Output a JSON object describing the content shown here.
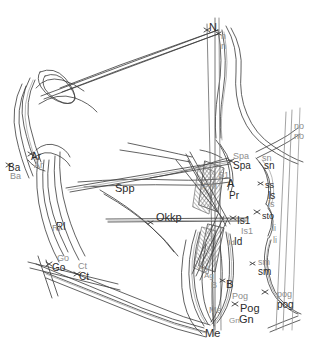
{
  "figure": {
    "kind": "cephalometric-tracing-superimposition",
    "background_color": "#ffffff",
    "line_color_primary": "#3a3a3a",
    "line_color_secondary": "#9a9a9a",
    "hatch_color": "#6f6f6f"
  },
  "labels": [
    {
      "id": "N",
      "text": "N",
      "x": 209,
      "y": 22,
      "tone": "dark",
      "size": "s11"
    },
    {
      "id": "n1",
      "text": "n",
      "x": 221,
      "y": 32,
      "tone": "grey",
      "size": "s9"
    },
    {
      "id": "n2",
      "text": "n",
      "x": 221,
      "y": 42,
      "tone": "grey",
      "size": "s9"
    },
    {
      "id": "no1",
      "text": "no",
      "x": 294,
      "y": 122,
      "tone": "grey",
      "size": "s9"
    },
    {
      "id": "no2",
      "text": "no",
      "x": 294,
      "y": 132,
      "tone": "grey",
      "size": "s9"
    },
    {
      "id": "Ar1",
      "text": "Ar",
      "x": 31,
      "y": 152,
      "tone": "dark",
      "size": "s10"
    },
    {
      "id": "Ar2",
      "text": "Ar",
      "x": 34,
      "y": 161,
      "tone": "grey",
      "size": "s9"
    },
    {
      "id": "Ba1",
      "text": "Ba",
      "x": 8,
      "y": 163,
      "tone": "dark",
      "size": "s10"
    },
    {
      "id": "Ba2",
      "text": "Ba",
      "x": 10,
      "y": 172,
      "tone": "grey",
      "size": "s9"
    },
    {
      "id": "Spa1",
      "text": "Spa",
      "x": 233,
      "y": 152,
      "tone": "grey",
      "size": "s9"
    },
    {
      "id": "Spa2",
      "text": "Spa",
      "x": 233,
      "y": 161,
      "tone": "dark",
      "size": "s10"
    },
    {
      "id": "sn1",
      "text": "sn",
      "x": 262,
      "y": 154,
      "tone": "grey",
      "size": "s9"
    },
    {
      "id": "sn2",
      "text": "sn",
      "x": 264,
      "y": 161,
      "tone": "dark",
      "size": "s10"
    },
    {
      "id": "S1",
      "text": "S1",
      "x": 218,
      "y": 171,
      "tone": "grey",
      "size": "s9"
    },
    {
      "id": "A",
      "text": "A",
      "x": 227,
      "y": 178,
      "tone": "dark",
      "size": "s11"
    },
    {
      "id": "Spp",
      "text": "Spp",
      "x": 115,
      "y": 183,
      "tone": "dark",
      "size": "s11"
    },
    {
      "id": "Prn",
      "text": "Prn",
      "x": 203,
      "y": 182,
      "tone": "grey",
      "size": "s9"
    },
    {
      "id": "Pr",
      "text": "Pr",
      "x": 229,
      "y": 191,
      "tone": "dark",
      "size": "s10"
    },
    {
      "id": "ss",
      "text": "ss",
      "x": 265,
      "y": 181,
      "tone": "dark",
      "size": "s9"
    },
    {
      "id": "ls1",
      "text": "ls",
      "x": 268,
      "y": 191,
      "tone": "dark",
      "size": "s10"
    },
    {
      "id": "ls2",
      "text": "ls",
      "x": 268,
      "y": 200,
      "tone": "grey",
      "size": "s9"
    },
    {
      "id": "Okkp",
      "text": "Okkp",
      "x": 156,
      "y": 212,
      "tone": "dark",
      "size": "s11"
    },
    {
      "id": "Is1a",
      "text": "Is1",
      "x": 237,
      "y": 216,
      "tone": "dark",
      "size": "s10"
    },
    {
      "id": "sto",
      "text": "sto",
      "x": 262,
      "y": 212,
      "tone": "dark",
      "size": "s9"
    },
    {
      "id": "Is1b",
      "text": "Is1",
      "x": 241,
      "y": 227,
      "tone": "grey",
      "size": "s9"
    },
    {
      "id": "li1",
      "text": "li",
      "x": 272,
      "y": 224,
      "tone": "grey",
      "size": "s9"
    },
    {
      "id": "Ida",
      "text": "Id",
      "x": 234,
      "y": 237,
      "tone": "dark",
      "size": "s10"
    },
    {
      "id": "Idb",
      "text": "Id",
      "x": 228,
      "y": 239,
      "tone": "grey",
      "size": "s8"
    },
    {
      "id": "li2",
      "text": "li",
      "x": 273,
      "y": 236,
      "tone": "grey",
      "size": "s9"
    },
    {
      "id": "Rl1",
      "text": "Rl",
      "x": 56,
      "y": 222,
      "tone": "dark",
      "size": "s10"
    },
    {
      "id": "Rl2",
      "text": "Rl",
      "x": 52,
      "y": 224,
      "tone": "grey",
      "size": "s9"
    },
    {
      "id": "sm1",
      "text": "sm",
      "x": 258,
      "y": 258,
      "tone": "grey",
      "size": "s9"
    },
    {
      "id": "sm2",
      "text": "sm",
      "x": 258,
      "y": 267,
      "tone": "dark",
      "size": "s10"
    },
    {
      "id": "Go1",
      "text": "Go",
      "x": 57,
      "y": 254,
      "tone": "grey",
      "size": "s9"
    },
    {
      "id": "Go2",
      "text": "Go",
      "x": 52,
      "y": 263,
      "tone": "dark",
      "size": "s10"
    },
    {
      "id": "Ct1",
      "text": "Ct",
      "x": 78,
      "y": 262,
      "tone": "grey",
      "size": "s9"
    },
    {
      "id": "Ct2",
      "text": "Ct",
      "x": 79,
      "y": 272,
      "tone": "dark",
      "size": "s10"
    },
    {
      "id": "Agb",
      "text": "Ag",
      "x": 198,
      "y": 264,
      "tone": "grey",
      "size": "s8"
    },
    {
      "id": "Aga",
      "text": "Ag",
      "x": 204,
      "y": 272,
      "tone": "grey",
      "size": "s8"
    },
    {
      "id": "B1",
      "text": "B",
      "x": 211,
      "y": 281,
      "tone": "grey",
      "size": "s9"
    },
    {
      "id": "B2",
      "text": "B",
      "x": 226,
      "y": 279,
      "tone": "dark",
      "size": "s11"
    },
    {
      "id": "pog1",
      "text": "pog",
      "x": 277,
      "y": 290,
      "tone": "grey",
      "size": "s9"
    },
    {
      "id": "pog2",
      "text": "pog",
      "x": 277,
      "y": 300,
      "tone": "dark",
      "size": "s10"
    },
    {
      "id": "Pog1",
      "text": "Pog",
      "x": 232,
      "y": 292,
      "tone": "grey",
      "size": "s9"
    },
    {
      "id": "Pog2",
      "text": "Pog",
      "x": 240,
      "y": 303,
      "tone": "dark",
      "size": "s11"
    },
    {
      "id": "Gn",
      "text": "Gn",
      "x": 239,
      "y": 314,
      "tone": "dark",
      "size": "s11"
    },
    {
      "id": "Gna",
      "text": "Gn",
      "x": 229,
      "y": 317,
      "tone": "grey",
      "size": "s8"
    },
    {
      "id": "Me1",
      "text": "Me",
      "x": 209,
      "y": 306,
      "tone": "grey",
      "size": "s9"
    },
    {
      "id": "Me2",
      "text": "Me",
      "x": 205,
      "y": 328,
      "tone": "dark",
      "size": "s11"
    }
  ]
}
